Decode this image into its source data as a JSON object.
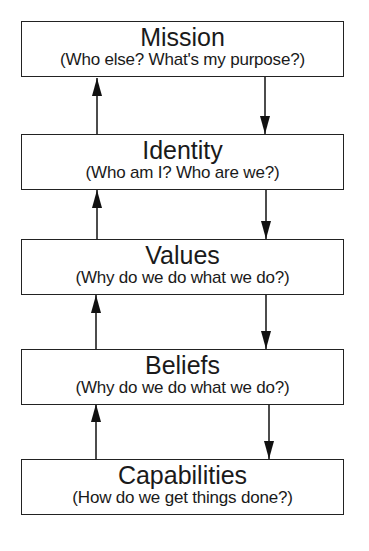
{
  "diagram": {
    "levels": [
      {
        "title": "Mission",
        "subtitle": "(Who else? What's my purpose?)"
      },
      {
        "title": "Identity",
        "subtitle": "(Who am I? Who are we?)"
      },
      {
        "title": "Values",
        "subtitle": "(Why do we do what we do?)"
      },
      {
        "title": "Beliefs",
        "subtitle": "(Why do we do what we do?)"
      },
      {
        "title": "Capabilities",
        "subtitle": "(How do we get things done?)"
      }
    ],
    "connectors": [
      {
        "from": "Identity",
        "to": "Mission",
        "direction": "up"
      },
      {
        "from": "Mission",
        "to": "Identity",
        "direction": "down"
      },
      {
        "from": "Values",
        "to": "Identity",
        "direction": "up"
      },
      {
        "from": "Identity",
        "to": "Values",
        "direction": "down"
      },
      {
        "from": "Beliefs",
        "to": "Values",
        "direction": "up"
      },
      {
        "from": "Values",
        "to": "Beliefs",
        "direction": "down"
      },
      {
        "from": "Capabilities",
        "to": "Beliefs",
        "direction": "up"
      },
      {
        "from": "Beliefs",
        "to": "Capabilities",
        "direction": "down"
      }
    ]
  }
}
